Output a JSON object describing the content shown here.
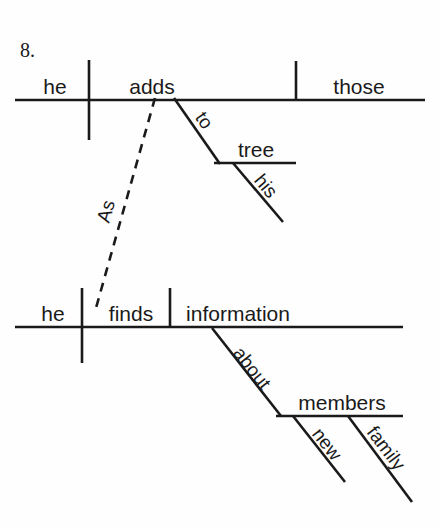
{
  "page": {
    "item_number": "8.",
    "background_color": "#fefefe",
    "ink_color": "#1a1a1a",
    "diagram_type": "reed-kellogg-sentence-diagram"
  },
  "clauses": [
    {
      "id": "main-clause",
      "role": "independent-clause",
      "subject": "he",
      "verb": "adds",
      "direct_object": "those",
      "modifiers": [
        {
          "id": "prep-to",
          "type": "prepositional-phrase",
          "preposition": "to",
          "object": "tree",
          "attaches_to": "adds",
          "object_modifiers": [
            {
              "id": "mod-his",
              "word": "his",
              "type": "possessive-adjective",
              "attaches_to": "tree"
            }
          ]
        }
      ]
    },
    {
      "id": "subordinate-clause",
      "role": "dependent-clause",
      "subject": "he",
      "verb": "finds",
      "direct_object": "information",
      "connector": {
        "id": "conjunction-as",
        "word": "As",
        "type": "subordinating-conjunction",
        "line_style": "dashed",
        "connects_from": "finds",
        "connects_to": "adds"
      },
      "modifiers": [
        {
          "id": "prep-about",
          "type": "prepositional-phrase",
          "preposition": "about",
          "object": "members",
          "attaches_to": "information",
          "object_modifiers": [
            {
              "id": "mod-new",
              "word": "new",
              "type": "adjective",
              "attaches_to": "members"
            },
            {
              "id": "mod-family",
              "word": "family",
              "type": "adjective",
              "attaches_to": "members"
            }
          ]
        }
      ]
    }
  ],
  "labels": {
    "item_number": "8.",
    "top_subject": "he",
    "top_verb": "adds",
    "top_object": "those",
    "prep_to": "to",
    "prep_to_object": "tree",
    "mod_his": "his",
    "conjunction_as": "As",
    "bottom_subject": "he",
    "bottom_verb": "finds",
    "bottom_object": "information",
    "prep_about": "about",
    "prep_about_object": "members",
    "mod_new": "new",
    "mod_family": "family"
  }
}
